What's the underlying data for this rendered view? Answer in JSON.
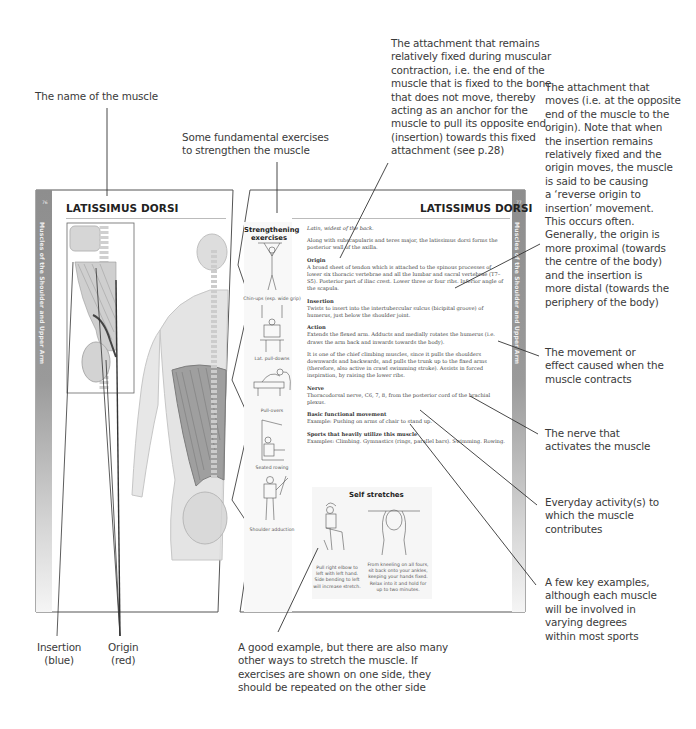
{
  "callouts": {
    "muscle_name": "The name of the muscle",
    "exercises": "Some fundamental exercises\nto strengthen the muscle",
    "origin": "The attachment that remains\nrelatively fixed during muscular\ncontraction, i.e. the end of the\nmuscle that is fixed to the bone\nthat does not move, thereby\nacting as an anchor for the\nmuscle to pull its opposite end\n(insertion) towards this fixed\nattachment (see p.28)",
    "insertion": "The attachment that\nmoves (i.e. at the opposite\nend of the muscle to the\norigin). Note that when\nthe insertion remains\nrelatively fixed and the\norigin moves, the muscle\nis said to be causing\na ‘reverse origin to\ninsertion’ movement.\nThis occurs often.\nGenerally, the origin is\nmore proximal (towards\nthe centre of the body)\nand the insertion is\nmore distal (towards the\nperiphery of the body)",
    "action": "The movement or\neffect caused when the\nmuscle contracts",
    "nerve": "The nerve that\nactivates the muscle",
    "functional": "Everyday activity(s) to\nwhich the muscle\ncontributes",
    "sports": "A few key examples,\nalthough each muscle\nwill be involved in\nvarying degrees\nwithin most sports",
    "stretch": "A good example, but there are also many\nother ways to stretch the muscle. If\nexercises are shown on one side, they\nshould be repeated on the other side",
    "insertion_legend": "Insertion\n(blue)",
    "origin_legend": "Origin\n(red)"
  },
  "left_page": {
    "page_number": "76",
    "sidebar": "Muscles of the Shoulder and Upper Arm",
    "title": "LATISSIMUS DORSI"
  },
  "right_page": {
    "page_number": "77",
    "sidebar": "Muscles of the Shoulder and Upper Arm",
    "title": "LATISSIMUS DORSI",
    "strengthening_title": "Strengthening\nexercises",
    "exercises": [
      {
        "label": "Chin-ups (esp. wide grip)"
      },
      {
        "label": "Lat. pull-downs"
      },
      {
        "label": "Pull-overs"
      },
      {
        "label": "Seated rowing"
      },
      {
        "label": "Shoulder adduction"
      }
    ],
    "intro": "Latin, widest of the back.",
    "intro2": "Along with subscapularis and teres major, the latissimus dorsi forms the posterior wall of the axilla.",
    "sections": [
      {
        "heading": "Origin",
        "text": "A broad sheet of tendon which is attached to the spinous processes of lower six thoracic vertebrae and all the lumbar and sacral vertebrae (T7–S5). Posterior part of iliac crest. Lower three or four ribs. Inferior angle of the scapula."
      },
      {
        "heading": "Insertion",
        "text": "Twists to insert into the intertubercular sulcus (bicipital groove) of humerus, just below the shoulder joint."
      },
      {
        "heading": "Action",
        "text": "Extends the flexed arm. Adducts and medially rotates the humerus (i.e. draws the arm back and inwards towards the body)."
      },
      {
        "heading": "",
        "text": "It is one of the chief climbing muscles, since it pulls the shoulders downwards and backwards, and pulls the trunk up to the fixed arms (therefore, also active in crawl swimming stroke). Assists in forced inspiration, by raising the lower ribs."
      },
      {
        "heading": "Nerve",
        "text": "Thoracodorsal nerve, C6, 7, 8, from the posterior cord of the brachial plexus."
      },
      {
        "heading": "Basic functional movement",
        "text": "Example: Pushing on arms of chair to stand up."
      },
      {
        "heading": "Sports that heavily utilize this muscle",
        "text": "Examples: Climbing. Gymnastics (rings, parallel bars). Swimming. Rowing."
      }
    ],
    "self_stretches": {
      "title": "Self stretches",
      "captions": [
        "Pull right elbow to\nleft with left hand.\nSide bending to left\nwill increase stretch.",
        "From kneeling on all fours,\nsit back onto your ankles,\nkeeping your hands fixed.\nRelax into it and hold for\nup to two minutes."
      ]
    }
  }
}
